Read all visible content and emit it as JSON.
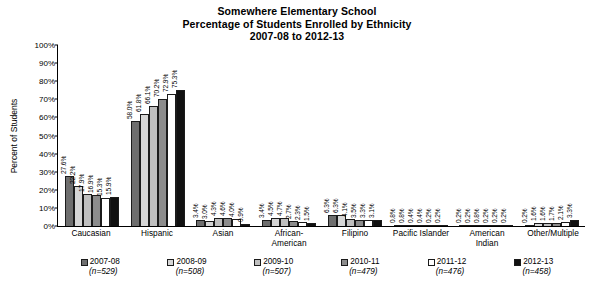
{
  "chart_data": {
    "type": "bar",
    "title": "Somewhere Elementary School",
    "subtitle": "Percentage of Students Enrolled by Ethnicity",
    "subtitle2": "2007-08 to 2012-13",
    "xlabel": "",
    "ylabel": "Percent of Students",
    "ylim": [
      0,
      100
    ],
    "ytick_labels": [
      "100%",
      "90%",
      "80%",
      "70%",
      "60%",
      "50%",
      "40%",
      "30%",
      "20%",
      "10%",
      "0%"
    ],
    "ytick_values": [
      100,
      90,
      80,
      70,
      60,
      50,
      40,
      30,
      20,
      10,
      0
    ],
    "grid": false,
    "legend_position": "bottom",
    "categories": [
      "Caucasian",
      "Hispanic",
      "Asian",
      "African-\nAmerican",
      "Filipino",
      "Pacific Islander",
      "American\nIndian",
      "Other/Multiple"
    ],
    "series": [
      {
        "name": "2007-08",
        "n": "(n=529)",
        "color": "#6e6e6e",
        "values": [
          27.6,
          58.0,
          3.4,
          3.4,
          6.3,
          0.8,
          0.2,
          0.2
        ],
        "labels": [
          "27.6%",
          "58.0%",
          "3.4%",
          "3.4%",
          "6.3%",
          "0.8%",
          "0.2%",
          "0.2%"
        ]
      },
      {
        "name": "2008-09",
        "n": "(n=508)",
        "color": "#d6d6d6",
        "values": [
          22.2,
          61.8,
          3.0,
          4.5,
          6.3,
          0.8,
          0.2,
          1.6
        ],
        "labels": [
          "22.2%",
          "61.8%",
          "3.0%",
          "4.5%",
          "6.3%",
          "0.8%",
          "0.2%",
          "1.6%"
        ]
      },
      {
        "name": "2009-10",
        "n": "(n=507)",
        "color": "#bfbfbf",
        "values": [
          17.9,
          66.1,
          4.3,
          4.7,
          4.1,
          0.4,
          0.8,
          1.6
        ],
        "labels": [
          "17.9%",
          "66.1%",
          "4.3%",
          "4.7%",
          "4.1%",
          "0.4%",
          "0.8%",
          "1.6%"
        ]
      },
      {
        "name": "2010-11",
        "n": "(n=479)",
        "color": "#8c8c8c",
        "values": [
          16.9,
          70.2,
          4.6,
          2.7,
          3.5,
          0.4,
          0.2,
          1.7
        ],
        "labels": [
          "16.9%",
          "70.2%",
          "4.6%",
          "2.7%",
          "3.5%",
          "0.4%",
          "0.2%",
          "1.7%"
        ]
      },
      {
        "name": "2011-12",
        "n": "(n=476)",
        "color": "#ffffff",
        "values": [
          15.3,
          72.9,
          4.0,
          2.3,
          3.3,
          0.2,
          0.2,
          2.1
        ],
        "labels": [
          "15.3%",
          "72.9%",
          "4.0%",
          "2.3%",
          "3.3%",
          "0.2%",
          "0.2%",
          "2.1%"
        ]
      },
      {
        "name": "2012-13",
        "n": "(n=458)",
        "color": "#111111",
        "values": [
          15.9,
          75.3,
          0.9,
          1.5,
          3.1,
          0.2,
          0.2,
          3.3
        ],
        "labels": [
          "15.9%",
          "75.3%",
          "0.9%",
          "1.5%",
          "3.1%",
          "0.2%",
          "0.2%",
          "3.3%"
        ]
      }
    ]
  }
}
